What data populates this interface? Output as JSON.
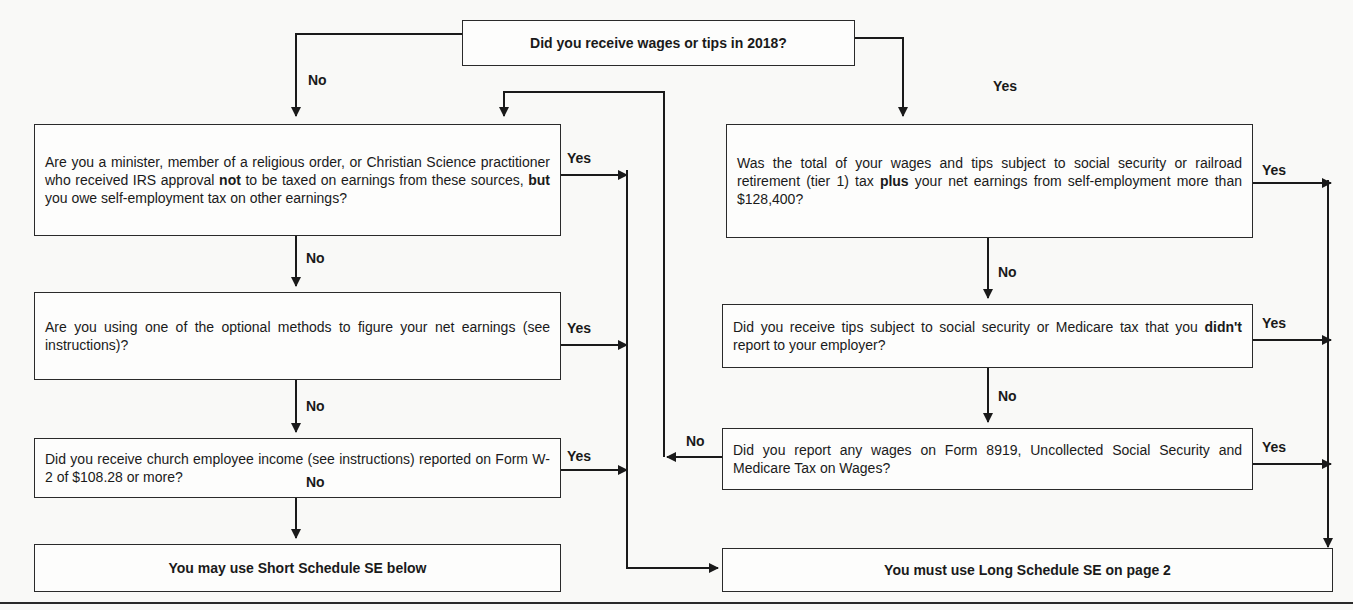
{
  "flowchart": {
    "start": "Did you receive wages or tips in 2018?",
    "left": {
      "q1": {
        "pre": "Are you a minister, member of a religious order, or Christian Science practitioner who received IRS approval ",
        "b1": "not",
        "mid": " to be taxed on earnings from these sources, ",
        "b2": "but",
        "post": " you owe self-employment tax on other earnings?"
      },
      "q2": "Are you using one of the optional methods to figure your net earnings (see instructions)?",
      "q3": "Did you receive church employee income (see instructions) reported on Form  W-2 of $108.28 or more?",
      "result": "You may use Short Schedule SE below"
    },
    "right": {
      "q1": {
        "pre": "Was the total of your wages and tips subject to social security or railroad retirement (tier 1) tax ",
        "b1": "plus",
        "post": " your net earnings from self-employment more than $128,400?"
      },
      "q2": {
        "pre": "Did you receive tips subject to social security or Medicare tax that you ",
        "b1": "didn't",
        "post": " report to your employer?"
      },
      "q3": "Did you report any wages on Form 8919, Uncollected Social Security and Medicare Tax on Wages?",
      "result": "You must use Long Schedule SE on page 2"
    },
    "labels": {
      "yes": "Yes",
      "no": "No"
    }
  }
}
